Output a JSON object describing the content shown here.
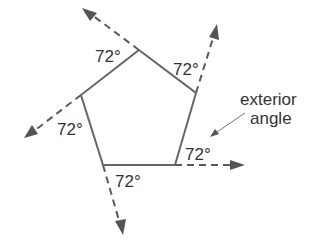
{
  "diagram": {
    "colors": {
      "edge": "#666666",
      "extension": "#5a5a5a",
      "text": "#333333",
      "background": "#ffffff"
    },
    "pentagon": {
      "vertices": [
        {
          "name": "top",
          "x": 139,
          "y": 50
        },
        {
          "name": "upper-right",
          "x": 196,
          "y": 93
        },
        {
          "name": "lower-right",
          "x": 175,
          "y": 165
        },
        {
          "name": "lower-left",
          "x": 103,
          "y": 165
        },
        {
          "name": "upper-left",
          "x": 81,
          "y": 95
        }
      ]
    },
    "exterior_angles": [
      {
        "vertex": "top",
        "label": "72°",
        "label_x": 95,
        "label_y": 62,
        "arrow_tip": {
          "x": 82,
          "y": 8
        }
      },
      {
        "vertex": "upper-right",
        "label": "72°",
        "label_x": 173,
        "label_y": 75,
        "arrow_tip": {
          "x": 217,
          "y": 24
        }
      },
      {
        "vertex": "lower-right",
        "label": "72°",
        "label_x": 185,
        "label_y": 160,
        "arrow_tip": {
          "x": 245,
          "y": 165
        }
      },
      {
        "vertex": "lower-left",
        "label": "72°",
        "label_x": 115,
        "label_y": 187,
        "arrow_tip": {
          "x": 123,
          "y": 235
        }
      },
      {
        "vertex": "upper-left",
        "label": "72°",
        "label_x": 57,
        "label_y": 135,
        "arrow_tip": {
          "x": 24,
          "y": 138
        }
      }
    ],
    "callout": {
      "line1": "exterior",
      "line2": "angle",
      "pointer_from": {
        "x": 245,
        "y": 113
      },
      "pointer_to": {
        "x": 211,
        "y": 136
      }
    }
  }
}
